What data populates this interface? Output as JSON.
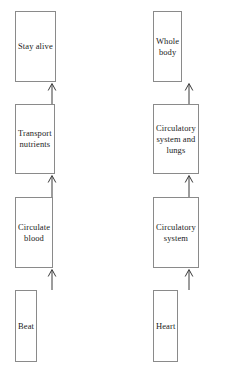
{
  "diagram": {
    "type": "flowchart",
    "title": "",
    "orientation": "bottom-to-top",
    "arrow_direction": "up",
    "colors": {
      "background": "#ffffff",
      "box_border": "#8a8a8a",
      "box_fill": "#ffffff",
      "text": "#1b1b1b",
      "arrow": "#3a3a3a"
    },
    "columns": [
      {
        "name": "function-chain",
        "nodes": [
          {
            "id": "stay-alive",
            "label": "Stay alive"
          },
          {
            "id": "transport-nutrients",
            "label": "Transport\nnutrients"
          },
          {
            "id": "circulate-blood",
            "label": "Circulate\nblood"
          },
          {
            "id": "beat",
            "label": "Beat"
          }
        ],
        "connectors": [
          {
            "from": "transport-nutrients",
            "to": "stay-alive",
            "glyph": "arrow-up-icon"
          },
          {
            "from": "circulate-blood",
            "to": "transport-nutrients",
            "glyph": "arrow-up-icon"
          },
          {
            "from": "beat",
            "to": "circulate-blood",
            "glyph": "arrow-up-icon"
          }
        ]
      },
      {
        "name": "structure-chain",
        "nodes": [
          {
            "id": "whole-body",
            "label": "Whole\nbody"
          },
          {
            "id": "circulatory-system-and-lungs",
            "label": "Circulatory\nsystem and\nlungs"
          },
          {
            "id": "circulatory-system",
            "label": "Circulatory\nsystem"
          },
          {
            "id": "heart",
            "label": "Heart"
          }
        ],
        "connectors": [
          {
            "from": "circulatory-system-and-lungs",
            "to": "whole-body",
            "glyph": "arrow-up-icon"
          },
          {
            "from": "circulatory-system",
            "to": "circulatory-system-and-lungs",
            "glyph": "arrow-up-icon"
          },
          {
            "from": "heart",
            "to": "circulatory-system",
            "glyph": "arrow-up-icon"
          }
        ]
      }
    ]
  }
}
